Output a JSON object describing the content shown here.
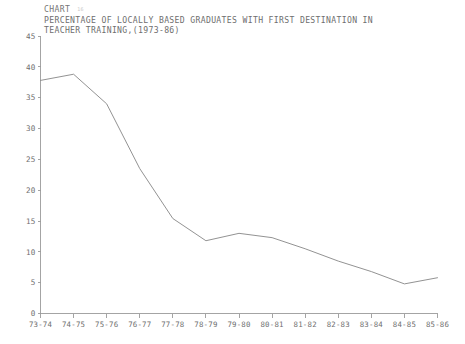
{
  "title": {
    "line1": "CHART",
    "chart_number": "16",
    "line2": "PERCENTAGE OF LOCALLY BASED GRADUATES WITH FIRST DESTINATION IN",
    "line3": "TEACHER TRAINING,(1973-86)"
  },
  "colors": {
    "line": "#8c8c8c",
    "axis": "#9a9a9a",
    "text": "#6e6e6e",
    "background": "#ffffff"
  },
  "chart_data": {
    "type": "line",
    "title": "PERCENTAGE OF LOCALLY BASED GRADUATES WITH FIRST DESTINATION IN TEACHER TRAINING,(1973-86)",
    "xlabel": "",
    "ylabel": "",
    "categories": [
      "73-74",
      "74-75",
      "75-76",
      "76-77",
      "77-78",
      "78-79",
      "79-80",
      "80-81",
      "81-82",
      "82-83",
      "83-84",
      "84-85",
      "85-86"
    ],
    "values": [
      37.8,
      38.8,
      34.0,
      23.5,
      15.4,
      11.8,
      13.0,
      12.3,
      10.5,
      8.5,
      6.8,
      4.8,
      5.8
    ],
    "yticks": [
      0,
      5,
      10,
      15,
      20,
      25,
      30,
      35,
      40,
      45
    ],
    "ylim": [
      0,
      45
    ],
    "grid": false,
    "legend": null,
    "series": [
      {
        "name": "Percentage in teacher training",
        "values": [
          37.8,
          38.8,
          34.0,
          23.5,
          15.4,
          11.8,
          13.0,
          12.3,
          10.5,
          8.5,
          6.8,
          4.8,
          5.8
        ]
      }
    ]
  }
}
